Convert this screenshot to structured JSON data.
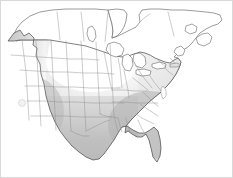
{
  "figure": {
    "title": "North America choropleth map",
    "subtitle": "Contiguous United States with southern Canada",
    "width": 233,
    "height": 178,
    "background_color": "#ffffff",
    "border_color": "#d9d9d9",
    "outline_color": "#4a4a4a",
    "state_line_color": "#8c8c8c"
  },
  "legend": {
    "visible": false,
    "scale_label": "Value",
    "low_label": "Low",
    "high_label": "High",
    "low_color": "#ffffff",
    "mid_color": "#d5d5d5",
    "high_color": "#a9a9a9"
  },
  "shading": {
    "type": "continuous-grayscale",
    "description": "Gradient from near-white in the northern plains to medium gray across the southern and western states",
    "stops": [
      {
        "position": "northwest-coast",
        "color": "#c0c0c0"
      },
      {
        "position": "north-central",
        "color": "#fdfdfd"
      },
      {
        "position": "great-lakes",
        "color": "#eaeaea"
      },
      {
        "position": "northeast",
        "color": "#dedede"
      },
      {
        "position": "southwest",
        "color": "#b4b4b4"
      },
      {
        "position": "south-central",
        "color": "#b8b8b8"
      },
      {
        "position": "southeast",
        "color": "#b0b0b0"
      },
      {
        "position": "canada",
        "color": "#ffffff"
      }
    ]
  },
  "markers": [
    {
      "name": "california-point",
      "label": "",
      "x": 22,
      "y": 103,
      "radius": 3.5,
      "fill": "#f2f2f2",
      "stroke": "#cfcfcf"
    }
  ],
  "regions": {
    "canada_label": "Canada",
    "united_states_label": "United States",
    "great_lakes_label": "Great Lakes",
    "hudson_bay_label": "Hudson Bay",
    "gulf_of_mexico_label": "Gulf of Mexico"
  },
  "chart_data": {
    "type": "heatmap",
    "title": "North America choropleth map",
    "xlabel": "",
    "ylabel": "",
    "legend_position": "none",
    "grid": false,
    "colormap": "grays-reversed",
    "vmin": 0,
    "vmax": 100,
    "categories": [
      "Washington",
      "Oregon",
      "California",
      "Nevada",
      "Idaho",
      "Montana",
      "Wyoming",
      "Utah",
      "Arizona",
      "Colorado",
      "New Mexico",
      "North Dakota",
      "South Dakota",
      "Nebraska",
      "Kansas",
      "Oklahoma",
      "Texas",
      "Minnesota",
      "Iowa",
      "Missouri",
      "Arkansas",
      "Louisiana",
      "Wisconsin",
      "Illinois",
      "Michigan",
      "Indiana",
      "Ohio",
      "Kentucky",
      "Tennessee",
      "Mississippi",
      "Alabama",
      "Georgia",
      "Florida",
      "South Carolina",
      "North Carolina",
      "Virginia",
      "West Virginia",
      "Pennsylvania",
      "New York",
      "Vermont",
      "New Hampshire",
      "Maine",
      "Massachusetts",
      "Rhode Island",
      "Connecticut",
      "New Jersey",
      "Delaware",
      "Maryland"
    ],
    "values": [
      62,
      60,
      58,
      55,
      40,
      22,
      35,
      50,
      62,
      38,
      60,
      8,
      14,
      20,
      30,
      48,
      58,
      10,
      18,
      34,
      52,
      58,
      14,
      26,
      20,
      30,
      32,
      44,
      50,
      58,
      56,
      54,
      50,
      50,
      46,
      40,
      36,
      30,
      26,
      24,
      24,
      22,
      28,
      30,
      30,
      32,
      34,
      36
    ]
  }
}
